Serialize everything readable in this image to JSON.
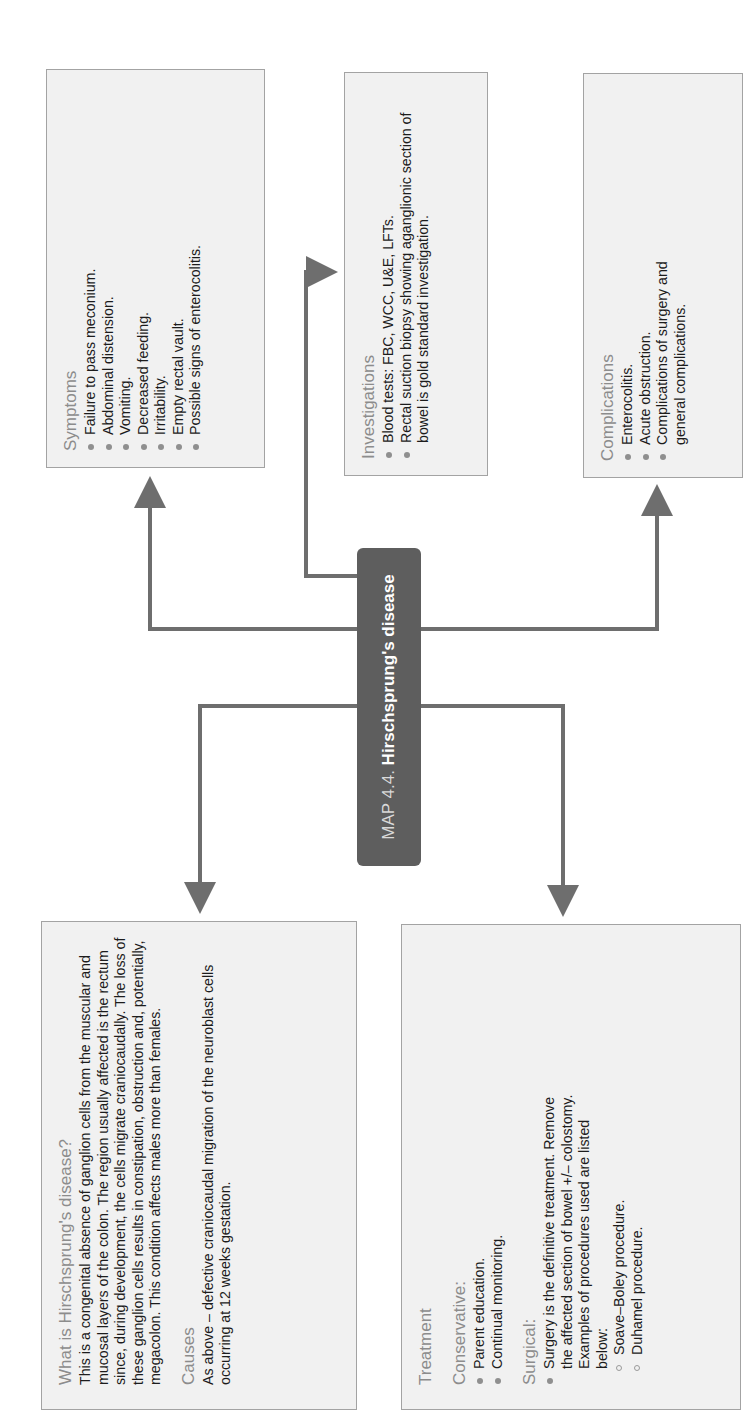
{
  "map": {
    "prefix": "MAP 4.4.",
    "title": "Hirschsprung's disease"
  },
  "symptoms": {
    "heading": "Symptoms",
    "items": [
      "Failure to pass meconium.",
      "Abdominal distension.",
      "Vomiting.",
      "Decreased feeding.",
      "Irritability.",
      "Empty rectal vault.",
      "Possible signs of enterocolitis."
    ]
  },
  "investigations": {
    "heading": "Investigations",
    "items": [
      "Blood tests: FBC, WCC, U&E, LFTs.",
      "Rectal suction biopsy showing aganglionic section of bowel is gold standard investigation."
    ]
  },
  "complications": {
    "heading": "Complications",
    "items": [
      "Enterocolitis.",
      "Acute obstruction.",
      "Complications of surgery and general complications."
    ]
  },
  "what_is": {
    "heading": "What is Hirschsprung's disease?",
    "body": "This is a congenital absence of ganglion cells from the muscular and mucosal layers of the colon. The region usually affected is the rectum since, during development, the cells migrate craniocaudally. The loss of these ganglion cells results in constipation, obstruction and, potentially, megacolon. This condition affects males more than females.",
    "causes_heading": "Causes",
    "causes_body": "As above – defective craniocaudal migration of the neuroblast cells occurring at 12 weeks gestation."
  },
  "treatment": {
    "heading": "Treatment",
    "conservative_heading": "Conservative:",
    "conservative_items": [
      "Parent education.",
      "Continual monitoring."
    ],
    "surgical_heading": "Surgical:",
    "surgical_items": [
      "Surgery is the definitive treatment. Remove the affected section of bowel +/– colostomy. Examples of procedures used are listed below:"
    ],
    "procedures": [
      "Soave–Boley procedure.",
      "Duhamel procedure."
    ]
  },
  "colors": {
    "box_fill": "#f1f1f1",
    "box_border": "#a3a3a3",
    "heading": "#8c8c8c",
    "connector": "#6e6e6e",
    "node_fill": "#5e5e5e"
  }
}
